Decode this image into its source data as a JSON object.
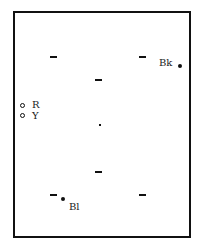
{
  "diagram": {
    "labels": {
      "black": "Bk",
      "blue": "Bl",
      "red": "R",
      "yellow": "Y"
    },
    "colors": {
      "stroke": "#111111",
      "background": "#ffffff"
    }
  }
}
